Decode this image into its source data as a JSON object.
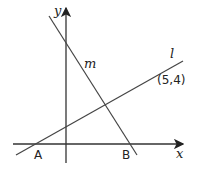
{
  "diagram": {
    "axes": {
      "x_label": "x",
      "y_label": "y"
    },
    "lines": [
      {
        "name": "l",
        "label": "l"
      },
      {
        "name": "m",
        "label": "m"
      }
    ],
    "points": [
      {
        "name": "A",
        "label": "A"
      },
      {
        "name": "B",
        "label": "B"
      },
      {
        "name": "P",
        "label": "(5,4)"
      }
    ],
    "stroke_color": "#333333"
  }
}
